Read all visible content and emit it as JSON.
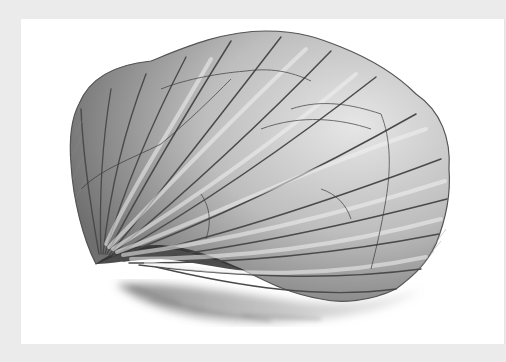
{
  "image": {
    "subject": "Pencil drawing of a scallop shell",
    "description": "Graphite sketch of a fan-shaped scallop shell with radiating ribs and concentric growth lines, resting on a lightly shaded surface",
    "style": "pencil sketch, grayscale",
    "colors": {
      "frame": "#ebebeb",
      "panel": "#ffffff",
      "shell_light": "#d9d9d9",
      "shell_mid": "#9a9a9a",
      "shell_dark": "#4a4a4a",
      "shadow": "#6e6e6e"
    }
  }
}
